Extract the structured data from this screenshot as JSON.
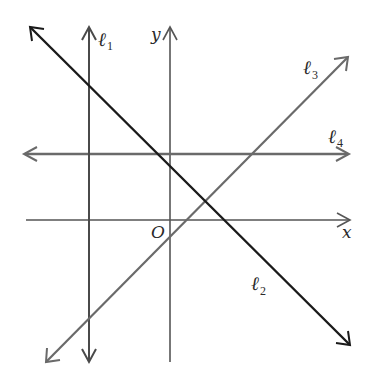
{
  "diagram": {
    "title": "",
    "axes": {
      "x_label": "x",
      "y_label": "y",
      "origin_label": "O",
      "color": "#555555"
    },
    "lines": [
      {
        "id": "l1",
        "name": "ℓ",
        "sub": "1",
        "description": "vertical line left of y-axis",
        "color": "#4a4a4a"
      },
      {
        "id": "l2",
        "name": "ℓ",
        "sub": "2",
        "description": "line with negative slope",
        "color": "#1a1a1a"
      },
      {
        "id": "l3",
        "name": "ℓ",
        "sub": "3",
        "description": "line with positive slope, negative y-intercept",
        "color": "#6a6a6a"
      },
      {
        "id": "l4",
        "name": "ℓ",
        "sub": "4",
        "description": "horizontal line above x-axis",
        "color": "#6a6a6a"
      }
    ]
  }
}
